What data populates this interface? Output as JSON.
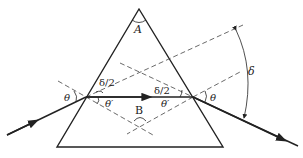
{
  "diagram": {
    "colors": {
      "line": "#222222",
      "dashed": "#444444",
      "background": "#ffffff"
    },
    "labels": {
      "apex_angle": "A",
      "angle_B": "B",
      "incident_angle_left": "θ",
      "incident_angle_right": "θ",
      "refracted_angle_left": "θ′",
      "refracted_angle_right": "θ′",
      "half_deviation_left": "δ/2",
      "half_deviation_right": "δ/2",
      "deviation": "δ"
    }
  }
}
